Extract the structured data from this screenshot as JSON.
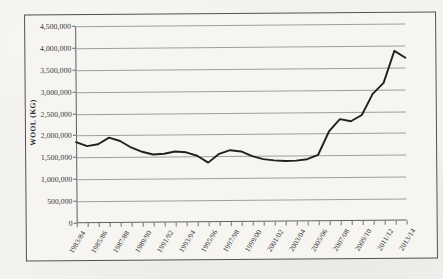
{
  "chart_data": {
    "type": "line",
    "title": "",
    "xlabel": "",
    "ylabel": "WOOL (KG)",
    "ylim": [
      0,
      4500000
    ],
    "ytick_step": 500000,
    "grid": true,
    "legend": "none",
    "yticks": [
      "0",
      "500,000",
      "1,000,000",
      "1,500,000",
      "2,000,000",
      "2,500,000",
      "3,000,000",
      "3,500,000",
      "4,000,000",
      "4,500,000"
    ],
    "categories": [
      "1983/84",
      "1984/85",
      "1985/86",
      "1986/87",
      "1987/88",
      "1988/89",
      "1989/90",
      "1990/91",
      "1991/92",
      "1992/93",
      "1993/94",
      "1994/95",
      "1995/96",
      "1996/97",
      "1997/98",
      "1998/99",
      "1999/00",
      "2000/01",
      "2001/02",
      "2002/03",
      "2003/04",
      "2004/05",
      "2005/06",
      "2006/07",
      "2007/08",
      "2008/09",
      "2009/10",
      "2010/11",
      "2011/12",
      "2012/13",
      "2013/14"
    ],
    "xtick_labels": [
      "1983/84",
      "1985/86",
      "1987/88",
      "1989/90",
      "1991/92",
      "1993/94",
      "1995/96",
      "1997/98",
      "1999/00",
      "2001/02",
      "2003/04",
      "2005/06",
      "2007/08",
      "2009/10",
      "2011/12",
      "2013/14"
    ],
    "values": [
      1850000,
      1790000,
      1760000,
      1950000,
      1880000,
      1740000,
      1640000,
      1560000,
      1555000,
      1620000,
      1600000,
      1540000,
      1590000,
      1640000,
      1540000,
      1360000,
      1480000,
      1500000,
      1430000,
      1395000,
      1385000,
      1400000,
      1430000,
      1510000,
      1520000,
      1560000,
      1620000,
      1700000,
      1800000,
      1900000,
      2050000
    ],
    "series": [
      {
        "name": "Wool (kg)",
        "values": [
          1850000,
          1760000,
          1800000,
          1950000,
          1870000,
          1720000,
          1620000,
          1555000,
          1570000,
          1620000,
          1600000,
          1520000,
          1360000,
          1560000,
          1640000,
          1610000,
          1500000,
          1430000,
          1400000,
          1385000,
          1390000,
          1420000,
          1520000,
          2050000,
          2330000,
          2280000,
          2420000,
          2900000,
          3150000,
          3880000,
          3720000
        ]
      }
    ]
  }
}
